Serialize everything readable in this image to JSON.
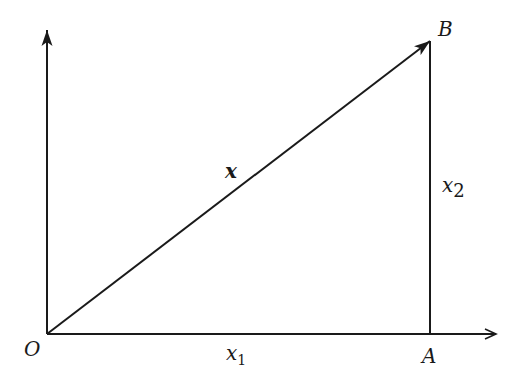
{
  "diagram": {
    "type": "vector-decomposition",
    "colors": {
      "stroke": "#1a1a1a",
      "background": "#ffffff"
    },
    "points": {
      "origin": {
        "label": "O",
        "x": 47,
        "y": 334
      },
      "A": {
        "label": "A",
        "x": 430,
        "y": 334
      },
      "B": {
        "label": "B",
        "x": 430,
        "y": 41
      }
    },
    "axes": {
      "horizontal": {
        "from": [
          47,
          334
        ],
        "to": [
          497,
          334
        ]
      },
      "vertical": {
        "from": [
          47,
          334
        ],
        "to": [
          47,
          28
        ]
      }
    },
    "labels": {
      "origin": "O",
      "point_a": "A",
      "point_b": "B",
      "vector": "x",
      "component_1": "x",
      "component_1_sub": "1",
      "component_2": "x",
      "component_2_sub": "2"
    }
  }
}
